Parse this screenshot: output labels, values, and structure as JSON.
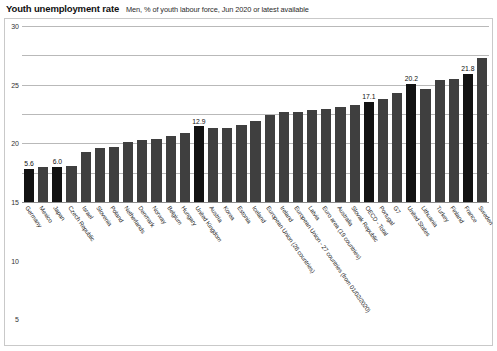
{
  "header": {
    "title": "Youth unemployment rate",
    "subtitle": "Men, % of youth labour force, Jun 2020 or latest available"
  },
  "chart_data": {
    "type": "bar",
    "title": "Youth unemployment rate",
    "subtitle": "Men, % of youth labour force, Jun 2020 or latest available",
    "xlabel": "",
    "ylabel": "",
    "ylim": [
      0,
      30
    ],
    "yticks": [
      0,
      5,
      10,
      15,
      20,
      25,
      30
    ],
    "grid": true,
    "legend": false,
    "categories": [
      "Germany",
      "Mexico",
      "Japan",
      "Czech Republic",
      "Israel",
      "Slovenia",
      "Poland",
      "Netherlands",
      "Denmark",
      "Norway",
      "Belgium",
      "Hungary",
      "United Kingdom",
      "Austria",
      "Korea",
      "Estonia",
      "Iceland",
      "European Union (28 countries)",
      "Ireland",
      "European Union - 27 countries (from 01/02/2020)",
      "Latvia",
      "Euro area (19 countries)",
      "Australia",
      "Slovak Republic",
      "OECD - Total",
      "Portugal",
      "G7",
      "United States",
      "Lithuania",
      "Turkey",
      "Finland",
      "France",
      "Sweden"
    ],
    "values": [
      5.6,
      6.0,
      6.0,
      6.2,
      8.6,
      9.2,
      9.4,
      10.2,
      10.5,
      10.8,
      11.2,
      11.8,
      12.9,
      12.6,
      12.7,
      13.2,
      13.8,
      14.8,
      15.3,
      15.4,
      15.6,
      15.9,
      16.2,
      16.6,
      17.1,
      17.6,
      18.6,
      20.2,
      19.3,
      20.8,
      20.9,
      21.8,
      24.5
    ],
    "labeled_points": [
      {
        "category": "Germany",
        "value": "5.6"
      },
      {
        "category": "Japan",
        "value": "6.0"
      },
      {
        "category": "United Kingdom",
        "value": "12.9"
      },
      {
        "category": "OECD - Total",
        "value": "17.1"
      },
      {
        "category": "United States",
        "value": "20.2"
      },
      {
        "category": "France",
        "value": "21.8"
      }
    ],
    "highlighted": [
      "Germany",
      "Japan",
      "United Kingdom",
      "OECD - Total",
      "United States",
      "France"
    ],
    "colors": {
      "bar": "#3f3f3f",
      "bar_highlight": "#121212",
      "gridline": "#b9b9b9",
      "frame": "#c9c9c9",
      "text": "#1a1a1a"
    }
  }
}
